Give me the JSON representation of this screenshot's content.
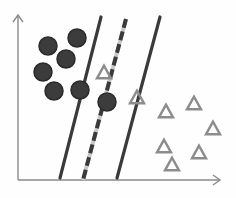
{
  "diagram": {
    "title": "",
    "colors": {
      "background": "#fefefe",
      "axis": "#8a8a8a",
      "line": "#3a3a3a",
      "circle_fill": "#3c3c3c",
      "circle_stroke": "#2a2a2a",
      "triangle_stroke": "#8c8c8c",
      "dashed_gap": "#c8c8c8"
    },
    "axes": {
      "origin": [
        18,
        180
      ],
      "y_top": [
        18,
        15
      ],
      "x_right": [
        220,
        180
      ]
    },
    "lines": [
      {
        "name": "margin-left",
        "style": "solid",
        "x1": 101,
        "y1": 17,
        "x2": 60,
        "y2": 178
      },
      {
        "name": "hyperplane",
        "style": "dashed",
        "x1": 126,
        "y1": 19,
        "x2": 83,
        "y2": 180
      },
      {
        "name": "margin-right",
        "style": "solid",
        "x1": 160,
        "y1": 17,
        "x2": 117,
        "y2": 178
      }
    ],
    "circles": [
      {
        "cx": 48,
        "cy": 46
      },
      {
        "cx": 77,
        "cy": 38
      },
      {
        "cx": 66,
        "cy": 59
      },
      {
        "cx": 43,
        "cy": 72
      },
      {
        "cx": 54,
        "cy": 91
      },
      {
        "cx": 80,
        "cy": 90
      },
      {
        "cx": 107,
        "cy": 102
      }
    ],
    "circle_radius": 9,
    "triangles": [
      {
        "cx": 104,
        "cy": 72
      },
      {
        "cx": 137,
        "cy": 97
      },
      {
        "cx": 166,
        "cy": 111
      },
      {
        "cx": 194,
        "cy": 103
      },
      {
        "cx": 213,
        "cy": 128
      },
      {
        "cx": 164,
        "cy": 146
      },
      {
        "cx": 199,
        "cy": 152
      },
      {
        "cx": 172,
        "cy": 164
      }
    ],
    "triangle_size": 14
  }
}
